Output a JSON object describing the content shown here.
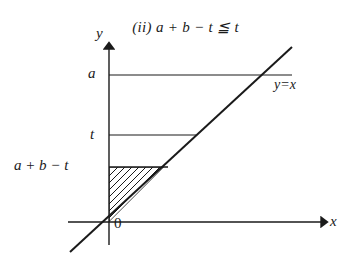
{
  "figure": {
    "caption": {
      "index": "(ii)",
      "expression": "a + b − t ≦ t",
      "full": "(ii) a + b − t ≦ t"
    },
    "axes": {
      "y_axis_label": "y",
      "x_axis_label": "x",
      "origin_label": "0"
    },
    "y_ticks": [
      {
        "label": "a",
        "value_y": 75
      },
      {
        "label": "t",
        "value_y": 135
      },
      {
        "label": "a + b − t",
        "value_y": 167
      }
    ],
    "lines": [
      {
        "name": "diagonal",
        "label": "y=x",
        "equation": "y = x"
      },
      {
        "name": "level-a",
        "label": "a"
      },
      {
        "name": "level-t",
        "label": "t"
      },
      {
        "name": "level-abt",
        "label": "a + b − t"
      }
    ],
    "shaded_region": {
      "name": "hatched-triangle",
      "description": "triangle bounded by y-axis, line y = a+b−t and line y = x",
      "hatch_count": 9
    },
    "colors": {
      "background": "#ffffff",
      "ink": "#1a1a1a"
    }
  }
}
